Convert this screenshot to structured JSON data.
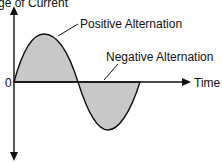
{
  "diagram": {
    "y_axis_label": "ge of Current",
    "x_axis_label": "Time",
    "origin_label": "0",
    "annotations": {
      "positive": "Positive Alternation",
      "negative": "Negative Alternation"
    },
    "colors": {
      "fill": "#c8c8c8",
      "stroke": "#111111"
    }
  }
}
